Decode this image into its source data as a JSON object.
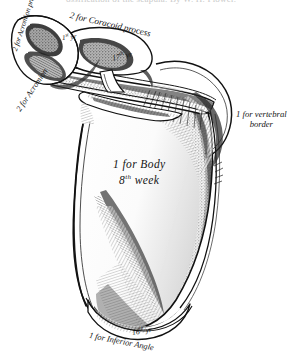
{
  "figure": {
    "background_color": "#ffffff",
    "ink_color": "#151515"
  },
  "header": {
    "clipped_line": "ossification of the scapula.  By W. H. Flower."
  },
  "labels": {
    "coracoid_process": "2 for Coracoid process",
    "acromion_process": "2 for Acromion process",
    "acromion": "2 for Acromion",
    "body_line1": "1 for Body",
    "body_line2_number": "8",
    "body_line2_ordinal": "th",
    "body_line2_unit": "week",
    "vertebral_border_line1": "1 for vertebral",
    "vertebral_border_line2": "border",
    "inferior_angle": "1 for Inferior Angle",
    "year_1st_number": "1",
    "year_1st_ordinal": "st",
    "year_1st_unit": "yr",
    "year_17th_number": "17",
    "year_17th_ordinal": "th",
    "year_17th_unit": "yr",
    "year_16th_number": "16",
    "year_16th_ordinal": "th",
    "year_16th_unit": "yr"
  }
}
